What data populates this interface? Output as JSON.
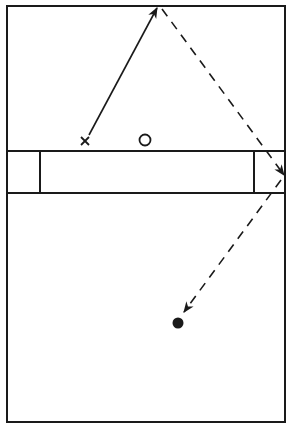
{
  "diagram": {
    "type": "court-drill-diagram",
    "colors": {
      "line": "#1a1a1a",
      "background": "#ffffff"
    },
    "court": {
      "outline": {
        "x": 7,
        "y": 6,
        "width": 278,
        "height": 416
      },
      "center_band": {
        "y_top": 151,
        "y_bottom": 193
      },
      "band_dividers_x": [
        40,
        254
      ]
    },
    "markers": [
      {
        "id": "attacker",
        "symbol": "x",
        "label": "X",
        "x": 85,
        "y": 141
      },
      {
        "id": "defender",
        "symbol": "o",
        "label": "O",
        "x": 145,
        "y": 140
      },
      {
        "id": "target",
        "symbol": "filled-dot",
        "label": "●",
        "x": 178,
        "y": 323
      }
    ],
    "paths": [
      {
        "id": "run-path",
        "style": "solid",
        "arrow": "end",
        "points": [
          [
            89,
            135
          ],
          [
            157,
            8
          ]
        ]
      },
      {
        "id": "pass-path",
        "style": "dashed",
        "arrow": "end",
        "points": [
          [
            162,
            9
          ],
          [
            284,
            175
          ]
        ]
      },
      {
        "id": "rebound-path",
        "style": "dashed",
        "arrow": "end",
        "points": [
          [
            281,
            180
          ],
          [
            184,
            312
          ]
        ]
      }
    ],
    "caption": ""
  }
}
